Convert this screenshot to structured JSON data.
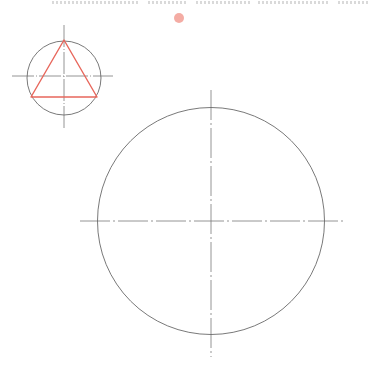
{
  "header": {
    "clipped_text_segments": [
      {
        "x": 52,
        "width": 88
      },
      {
        "x": 148,
        "width": 40
      },
      {
        "x": 196,
        "width": 55
      },
      {
        "x": 258,
        "width": 72
      },
      {
        "x": 338,
        "width": 30
      }
    ]
  },
  "colors": {
    "outline": "#6a6a6a",
    "centerline": "#7a7a7a",
    "triangle": "#e8675c",
    "marker_dot": "#f4aca4"
  },
  "marker_dot": {
    "cx": 179,
    "cy": 18,
    "r": 5
  },
  "small_circle": {
    "cx": 64,
    "cy": 78,
    "r": 37,
    "centerline_h": {
      "x1": 12,
      "x2": 113,
      "y": 76
    },
    "centerline_v": {
      "x": 64,
      "y1": 25,
      "y2": 128
    },
    "triangle": {
      "points": "64,40 31,97 97,97"
    }
  },
  "large_circle": {
    "cx": 211,
    "cy": 221,
    "r": 113.5,
    "centerline_h": {
      "x1": 80,
      "x2": 344,
      "y": 221
    },
    "centerline_v": {
      "x": 211,
      "y1": 90,
      "y2": 357
    }
  }
}
